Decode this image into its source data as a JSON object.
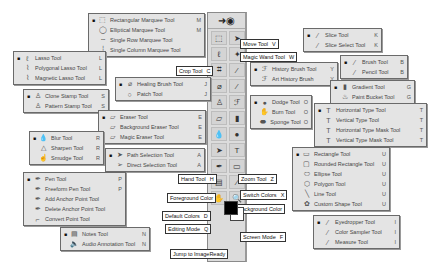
{
  "popups": {
    "marquee": [
      {
        "active": true,
        "icon": "rect-marquee-icon",
        "glyph": "⬚",
        "label": "Rectangular Marquee Tool",
        "key": "M"
      },
      {
        "active": false,
        "icon": "ellipse-marquee-icon",
        "glyph": "◯",
        "label": "Elliptical Marquee Tool",
        "key": "M"
      },
      {
        "active": false,
        "icon": "single-row-icon",
        "glyph": "┄",
        "label": "Single Row Marquee Tool",
        "key": ""
      },
      {
        "active": false,
        "icon": "single-column-icon",
        "glyph": "┆",
        "label": "Single Column Marquee Tool",
        "key": ""
      }
    ],
    "lasso": [
      {
        "active": true,
        "icon": "lasso-icon",
        "glyph": "ℓ",
        "label": "Lasso Tool",
        "key": "L"
      },
      {
        "active": false,
        "icon": "polygonal-lasso-icon",
        "glyph": "⌇",
        "label": "Polygonal Lasso Tool",
        "key": "L"
      },
      {
        "active": false,
        "icon": "magnetic-lasso-icon",
        "glyph": "⌇",
        "label": "Magnetic Lasso Tool",
        "key": "L"
      }
    ],
    "healing": [
      {
        "active": true,
        "icon": "healing-brush-icon",
        "glyph": "⌀",
        "label": "Healing Brush Tool",
        "key": "J"
      },
      {
        "active": false,
        "icon": "patch-icon",
        "glyph": "○",
        "label": "Patch Tool",
        "key": "J"
      }
    ],
    "stamp": [
      {
        "active": true,
        "icon": "clone-stamp-icon",
        "glyph": "♙",
        "label": "Clone Stamp Tool",
        "key": "S"
      },
      {
        "active": false,
        "icon": "pattern-stamp-icon",
        "glyph": "♙",
        "label": "Pattern Stamp Tool",
        "key": "S"
      }
    ],
    "eraser": [
      {
        "active": true,
        "icon": "eraser-icon",
        "glyph": "▱",
        "label": "Eraser Tool",
        "key": "E"
      },
      {
        "active": false,
        "icon": "background-eraser-icon",
        "glyph": "▱",
        "label": "Background Eraser Tool",
        "key": "E"
      },
      {
        "active": false,
        "icon": "magic-eraser-icon",
        "glyph": "▱",
        "label": "Magic Eraser Tool",
        "key": "E"
      }
    ],
    "blur": [
      {
        "active": true,
        "icon": "blur-icon",
        "glyph": "💧",
        "label": "Blur Tool",
        "key": "R"
      },
      {
        "active": false,
        "icon": "sharpen-icon",
        "glyph": "△",
        "label": "Sharpen Tool",
        "key": "R"
      },
      {
        "active": false,
        "icon": "smudge-icon",
        "glyph": "☝",
        "label": "Smudge Tool",
        "key": "R"
      }
    ],
    "path_selection": [
      {
        "active": true,
        "icon": "path-selection-icon",
        "glyph": "➤",
        "label": "Path Selection Tool",
        "key": "A"
      },
      {
        "active": false,
        "icon": "direct-selection-icon",
        "glyph": "➢",
        "label": "Direct Selection Tool",
        "key": "A"
      }
    ],
    "pen": [
      {
        "active": true,
        "icon": "pen-icon",
        "glyph": "✒",
        "label": "Pen Tool",
        "key": "P"
      },
      {
        "active": false,
        "icon": "freeform-pen-icon",
        "glyph": "✒",
        "label": "Freeform Pen Tool",
        "key": "P"
      },
      {
        "active": false,
        "icon": "add-anchor-icon",
        "glyph": "✒",
        "label": "Add Anchor Point Tool",
        "key": ""
      },
      {
        "active": false,
        "icon": "delete-anchor-icon",
        "glyph": "✒",
        "label": "Delete Anchor Point Tool",
        "key": ""
      },
      {
        "active": false,
        "icon": "convert-point-icon",
        "glyph": "⌐",
        "label": "Convert Point Tool",
        "key": ""
      }
    ],
    "notes": [
      {
        "active": true,
        "icon": "notes-icon",
        "glyph": "▤",
        "label": "Notes Tool",
        "key": "N"
      },
      {
        "active": false,
        "icon": "audio-annotation-icon",
        "glyph": "🔈",
        "label": "Audio Annotation Tool",
        "key": "N"
      }
    ],
    "slice": [
      {
        "active": true,
        "icon": "slice-icon",
        "glyph": "⁄",
        "label": "Slice Tool",
        "key": "K"
      },
      {
        "active": false,
        "icon": "slice-select-icon",
        "glyph": "⁄",
        "label": "Slice Select Tool",
        "key": "K"
      }
    ],
    "history": [
      {
        "active": true,
        "icon": "history-brush-icon",
        "glyph": "ℱ",
        "label": "History Brush Tool",
        "key": "Y"
      },
      {
        "active": false,
        "icon": "art-history-brush-icon",
        "glyph": "ℱ",
        "label": "Art History Brush",
        "key": "Y"
      }
    ],
    "brush": [
      {
        "active": true,
        "icon": "brush-icon",
        "glyph": "⁄",
        "label": "Brush Tool",
        "key": "B"
      },
      {
        "active": false,
        "icon": "pencil-icon",
        "glyph": "⁄",
        "label": "Pencil Tool",
        "key": "B"
      }
    ],
    "gradient": [
      {
        "active": true,
        "icon": "gradient-icon",
        "glyph": "▮",
        "label": "Gradient Tool",
        "key": "G"
      },
      {
        "active": false,
        "icon": "paint-bucket-icon",
        "glyph": "♨",
        "label": "Paint Bucket Tool",
        "key": "G"
      }
    ],
    "dodge": [
      {
        "active": true,
        "icon": "dodge-icon",
        "glyph": "●",
        "label": "Dodge Tool",
        "key": "O"
      },
      {
        "active": false,
        "icon": "burn-icon",
        "glyph": "✋",
        "label": "Burn Tool",
        "key": "O"
      },
      {
        "active": false,
        "icon": "sponge-icon",
        "glyph": "⬬",
        "label": "Sponge Tool",
        "key": "O"
      }
    ],
    "type": [
      {
        "active": true,
        "icon": "horizontal-type-icon",
        "glyph": "T",
        "label": "Horizontal Type Tool",
        "key": "T"
      },
      {
        "active": false,
        "icon": "vertical-type-icon",
        "glyph": "T",
        "label": "Vertical Type Tool",
        "key": "T"
      },
      {
        "active": false,
        "icon": "horizontal-type-mask-icon",
        "glyph": "T",
        "label": "Horizontal Type Mask Tool",
        "key": "T"
      },
      {
        "active": false,
        "icon": "vertical-type-mask-icon",
        "glyph": "T",
        "label": "Vertical Type Mask Tool",
        "key": "T"
      }
    ],
    "shape": [
      {
        "active": true,
        "icon": "rectangle-icon",
        "glyph": "▭",
        "label": "Rectangle Tool",
        "key": "U"
      },
      {
        "active": false,
        "icon": "rounded-rectangle-icon",
        "glyph": "▢",
        "label": "Rounded Rectangle Tool",
        "key": "U"
      },
      {
        "active": false,
        "icon": "ellipse-icon",
        "glyph": "⬭",
        "label": "Ellipse Tool",
        "key": "U"
      },
      {
        "active": false,
        "icon": "polygon-icon",
        "glyph": "⬡",
        "label": "Polygon Tool",
        "key": "U"
      },
      {
        "active": false,
        "icon": "line-icon",
        "glyph": "╲",
        "label": "Line Tool",
        "key": "U"
      },
      {
        "active": false,
        "icon": "custom-shape-icon",
        "glyph": "✿",
        "label": "Custom Shape Tool",
        "key": "U"
      }
    ],
    "eyedropper": [
      {
        "active": true,
        "icon": "eyedropper-icon",
        "glyph": "⁄",
        "label": "Eyedropper Tool",
        "key": "I"
      },
      {
        "active": false,
        "icon": "color-sampler-icon",
        "glyph": "⁄",
        "label": "Color Sampler Tool",
        "key": "I"
      },
      {
        "active": false,
        "icon": "measure-icon",
        "glyph": "⁄",
        "label": "Measure Tool",
        "key": "I"
      }
    ]
  },
  "labels": {
    "move": {
      "text": "Move Tool",
      "key": "V"
    },
    "magic_wand": {
      "text": "Magic Wand Tool",
      "key": "W"
    },
    "crop": {
      "text": "Crop Tool",
      "key": "C"
    },
    "hand": {
      "text": "Hand Tool",
      "key": "H"
    },
    "zoom": {
      "text": "Zoom Tool",
      "key": "Z"
    },
    "foreground": {
      "text": "Foreground Color",
      "key": ""
    },
    "switch_colors": {
      "text": "Switch Colors",
      "key": "X"
    },
    "background": {
      "text": "Background Color",
      "key": ""
    },
    "default_colors": {
      "text": "Default Colors",
      "key": "D"
    },
    "editing_mode": {
      "text": "Editing Mode",
      "key": "Q"
    },
    "screen_mode": {
      "text": "Screen Mode",
      "key": "F"
    },
    "jump": {
      "text": "Jump to ImageReady",
      "key": ""
    }
  },
  "toolbar": {
    "tools": [
      "⬚",
      "➤",
      "ℓ",
      "✦",
      "⌗",
      "⁄",
      "⌀",
      "⁄",
      "♙",
      "ℱ",
      "▱",
      "▮",
      "💧",
      "●",
      "➤",
      "T",
      "✒",
      "▭",
      "▤",
      "⁄",
      "✋",
      "🔍"
    ]
  },
  "colors": {
    "foreground": "#000000",
    "background": "#ffffff"
  }
}
